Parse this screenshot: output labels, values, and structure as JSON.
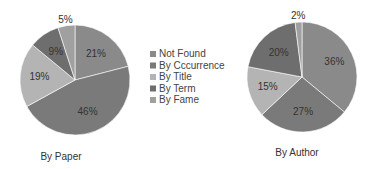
{
  "chart_data": [
    {
      "type": "pie",
      "title": "By Paper",
      "categories": [
        "Not Found",
        "By Cccurrence",
        "By Title",
        "By Term",
        "By Fame"
      ],
      "values": [
        21,
        46,
        19,
        9,
        5
      ],
      "labels": [
        "21%",
        "46%",
        "19%",
        "9%",
        "5%"
      ]
    },
    {
      "type": "pie",
      "title": "By Author",
      "categories": [
        "Not Found",
        "By Cccurrence",
        "By Title",
        "By Term",
        "By Fame"
      ],
      "values": [
        36,
        27,
        15,
        20,
        2
      ],
      "labels": [
        "36%",
        "27%",
        "15%",
        "20%",
        "2%"
      ]
    }
  ],
  "legend": {
    "placement": "center",
    "entries": [
      "Not Found",
      "By Cccurrence",
      "By Title",
      "By Term",
      "By Fame"
    ],
    "colors": [
      "#8a8a8a",
      "#7a7a7a",
      "#b4b4b4",
      "#6e6e6e",
      "#a0a0a0"
    ]
  }
}
